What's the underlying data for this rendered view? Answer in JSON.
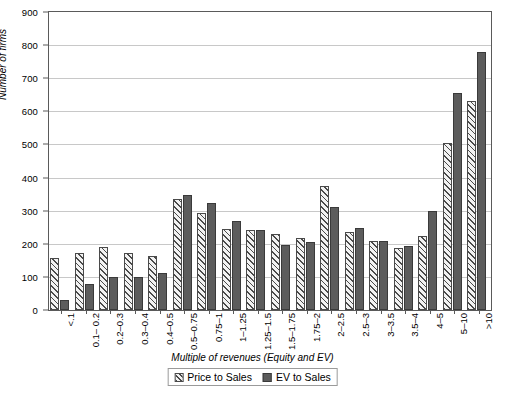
{
  "chart_data": {
    "type": "bar",
    "title": "",
    "xlabel": "Multiple of revenues (Equity and EV)",
    "ylabel": "Number of firms",
    "ylim": [
      0,
      900
    ],
    "ytick_step": 100,
    "yticks": [
      0,
      100,
      200,
      300,
      400,
      500,
      600,
      700,
      800,
      900
    ],
    "grid": true,
    "legend_position": "bottom-center",
    "categories": [
      "<.1",
      "0.1– 0.2",
      "0.2–0.3",
      "0.3–0.4",
      "0.4–0.5",
      "0.5–0.75",
      "0.75–1",
      "1–1.25",
      "1.25–1.5",
      "1.5–1.75",
      "1.75–2",
      "2–2.5",
      "2.5–3",
      "3–3.5",
      "3.5–4",
      "4–5",
      "5–10",
      ">10"
    ],
    "series": [
      {
        "name": "Price to Sales",
        "color": "#f2f2f2",
        "pattern": "diagonal-hatch",
        "values": [
          158,
          171,
          189,
          171,
          162,
          335,
          294,
          246,
          241,
          229,
          219,
          374,
          237,
          207,
          188,
          225,
          505,
          630
        ]
      },
      {
        "name": "EV to Sales",
        "color": "#5c5c5c",
        "pattern": "solid",
        "values": [
          29,
          80,
          101,
          99,
          111,
          348,
          322,
          270,
          242,
          196,
          206,
          311,
          248,
          207,
          192,
          298,
          655,
          778
        ]
      }
    ]
  },
  "legend": {
    "items": [
      {
        "label": "Price to Sales"
      },
      {
        "label": "EV to Sales"
      }
    ]
  },
  "axes": {
    "y_title": "Number of firms",
    "x_title": "Multiple of revenues (Equity and EV)"
  }
}
